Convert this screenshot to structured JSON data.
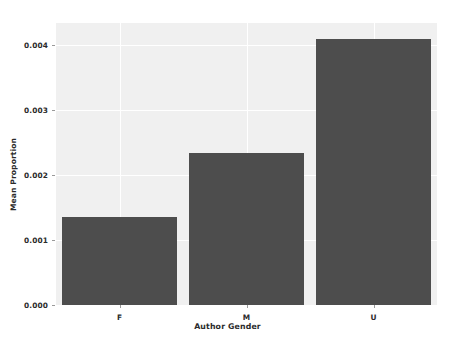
{
  "chart_data": {
    "type": "bar",
    "title": "",
    "subtitle": "",
    "xlabel": "Author Gender",
    "ylabel": "Mean Proportion",
    "categories": [
      "F",
      "M",
      "U"
    ],
    "values": [
      0.00136,
      0.00234,
      0.00409
    ],
    "series": [
      {
        "name": "Mean Proportion",
        "values": [
          0.00136,
          0.00234,
          0.00409
        ]
      }
    ],
    "ylim": [
      0.0,
      0.00434
    ],
    "xlim": [
      -0.5,
      2.5
    ],
    "ytick_labels": [
      "0.000",
      "0.001",
      "0.002",
      "0.003",
      "0.004"
    ],
    "ytick_values": [
      0.0,
      0.001,
      0.002,
      0.003,
      0.004
    ],
    "xtick_labels": [
      "F",
      "M",
      "U"
    ],
    "grid": true,
    "grid_axis": "both",
    "legend": false,
    "legend_position": "none",
    "bar_color": "#4d4d4d",
    "plot_background": "#f0f0f0",
    "figure_background": "#ffffff",
    "grid_color": "#ffffff",
    "tick_color": "#9a9a9a",
    "text_color": "#2b2b2b",
    "bar_width_fraction": 0.9,
    "annotations": []
  }
}
